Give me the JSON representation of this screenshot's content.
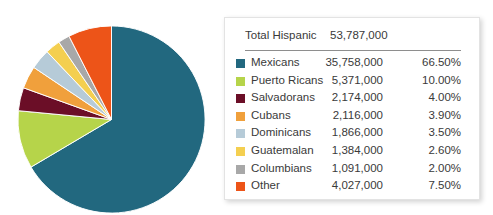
{
  "chart_data": {
    "type": "pie",
    "title": "",
    "categories": [
      "Mexicans",
      "Puerto Ricans",
      "Salvadorans",
      "Cubans",
      "Dominicans",
      "Guatemalan",
      "Columbians",
      "Other"
    ],
    "values": [
      35758000,
      5371000,
      2174000,
      2116000,
      1866000,
      1384000,
      1091000,
      4027000
    ],
    "value_labels": [
      "35,758,000",
      "5,371,000",
      "2,174,000",
      "2,116,000",
      "1,866,000",
      "1,384,000",
      "1,091,000",
      "4,027,000"
    ],
    "percentages": [
      66.5,
      10.0,
      4.0,
      3.9,
      3.5,
      2.6,
      2.0,
      7.5
    ],
    "percentage_labels": [
      "66.50%",
      "10.00%",
      "4.00%",
      "3.90%",
      "3.50%",
      "2.60%",
      "2.00%",
      "7.50%"
    ],
    "colors": [
      "#22687f",
      "#b6d44a",
      "#6b0e27",
      "#f0a03c",
      "#b6cbd8",
      "#f4cf50",
      "#a8a8a8",
      "#ed5418"
    ],
    "total_label": "Total Hispanic",
    "total_value": "53,787,000",
    "total": 53787000,
    "start_angle_deg": 0,
    "direction": "clockwise",
    "legend_position": "right",
    "grid": false,
    "xlabel": "",
    "ylabel": ""
  },
  "legend": {
    "total_label": "Total Hispanic",
    "total_value": "53,787,000",
    "rows": [
      {
        "label": "Mexicans",
        "value": "35,758,000",
        "pct": "66.50%",
        "color": "#22687f"
      },
      {
        "label": "Puerto Ricans",
        "value": "5,371,000",
        "pct": "10.00%",
        "color": "#b6d44a"
      },
      {
        "label": "Salvadorans",
        "value": "2,174,000",
        "pct": "4.00%",
        "color": "#6b0e27"
      },
      {
        "label": "Cubans",
        "value": "2,116,000",
        "pct": "3.90%",
        "color": "#f0a03c"
      },
      {
        "label": "Dominicans",
        "value": "1,866,000",
        "pct": "3.50%",
        "color": "#b6cbd8"
      },
      {
        "label": "Guatemalan",
        "value": "1,384,000",
        "pct": "2.60%",
        "color": "#f4cf50"
      },
      {
        "label": "Columbians",
        "value": "1,091,000",
        "pct": "2.00%",
        "color": "#a8a8a8"
      },
      {
        "label": "Other",
        "value": "4,027,000",
        "pct": "7.50%",
        "color": "#ed5418"
      }
    ]
  }
}
